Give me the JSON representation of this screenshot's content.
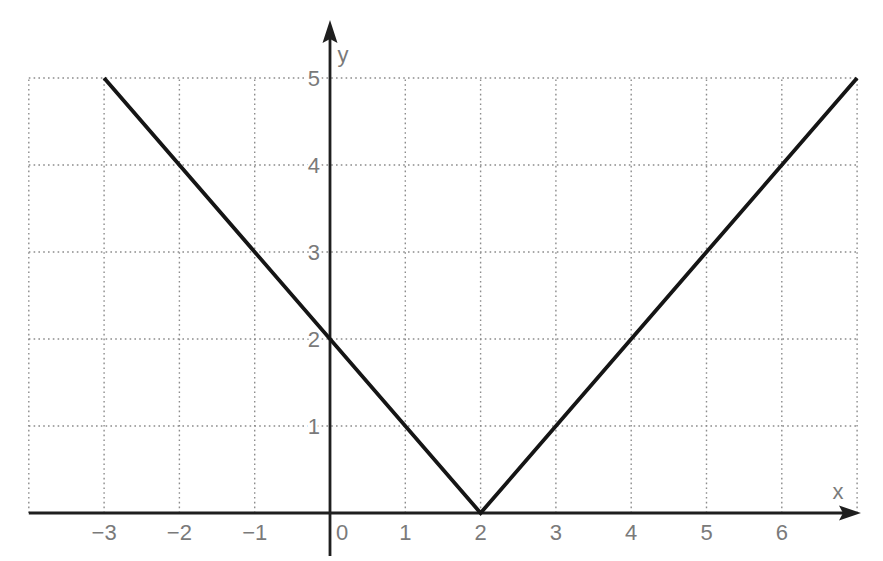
{
  "chart_data": {
    "type": "line",
    "title": "",
    "xlabel": "x",
    "ylabel": "y",
    "xlim": [
      -4,
      7
    ],
    "ylim": [
      0,
      5
    ],
    "x_ticks": [
      -3,
      -2,
      -1,
      0,
      1,
      2,
      3,
      4,
      5,
      6
    ],
    "y_ticks": [
      1,
      2,
      3,
      4,
      5
    ],
    "grid": "dotted",
    "legend": "none",
    "series": [
      {
        "shape": "absolute-value-V",
        "vertex": [
          2,
          0
        ],
        "points": [
          [
            -3,
            5
          ],
          [
            2,
            0
          ],
          [
            7,
            5
          ]
        ]
      }
    ],
    "colors": {
      "line": "#151515",
      "axis": "#1f1f1f",
      "grid": "#8c8c8c",
      "tick_labels": "#7a7a7a",
      "axis_labels": "#7a7a7a",
      "background": "#ffffff"
    }
  }
}
